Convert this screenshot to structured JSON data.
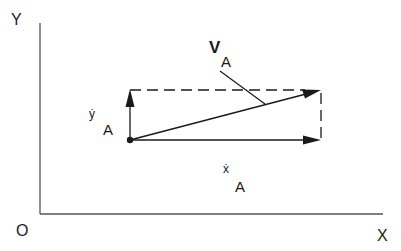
{
  "diagram": {
    "title": "",
    "colors": {
      "stroke": "#1a1a1a",
      "axis": "#555555",
      "background": "#ffffff"
    },
    "axes": {
      "origin_label": "O",
      "x_label": "X",
      "y_label": "Y"
    },
    "point": {
      "label": "A"
    },
    "vectors": {
      "velocity": {
        "symbol": "V",
        "subscript": "A",
        "description": "resultant velocity of point A"
      },
      "x_component": {
        "symbol": "ẋ",
        "subscript": "A",
        "description": "horizontal velocity component"
      },
      "y_component": {
        "symbol": "ẏ",
        "subscript": "A",
        "description": "vertical velocity component"
      }
    },
    "icons": {
      "point_marker": "filled-circle",
      "arrowhead": "solid-triangle"
    }
  }
}
